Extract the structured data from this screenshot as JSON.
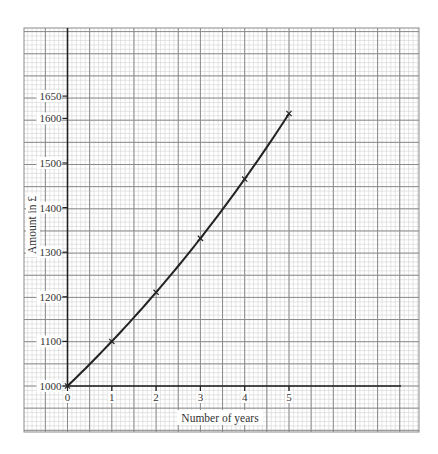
{
  "chart_data": {
    "type": "line",
    "title": "",
    "xlabel": "Number of years",
    "ylabel": "Amount in £",
    "x": [
      0,
      1,
      2,
      3,
      4,
      5
    ],
    "series": [
      {
        "name": "Amount",
        "values": [
          1000,
          1100,
          1210,
          1331,
          1464,
          1611
        ],
        "marker": "x",
        "color": "#222222"
      }
    ],
    "x_ticks": [
      "0",
      "1",
      "2",
      "3",
      "4",
      "5"
    ],
    "y_ticks": [
      "1000",
      "1100",
      "1200",
      "1300",
      "1400",
      "1500",
      "1600",
      "1650"
    ],
    "xlim": [
      0,
      7.7
    ],
    "ylim": [
      1000,
      1650
    ],
    "grid": true,
    "grid_style": "graph paper (major + minor lines)",
    "legend": null
  },
  "colors": {
    "background": "#ffffff",
    "minor_grid": "#d4d4d4",
    "major_grid": "#8a8a8a",
    "axis": "#222222",
    "curve": "#222222",
    "text": "#333333"
  }
}
